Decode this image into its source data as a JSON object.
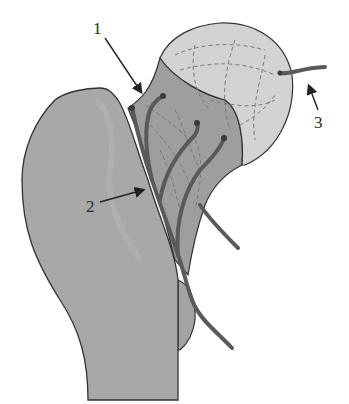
{
  "diagram": {
    "labels": [
      {
        "id": "1",
        "text": "1"
      },
      {
        "id": "2",
        "text": "2"
      },
      {
        "id": "3",
        "text": "3"
      }
    ],
    "colors": {
      "bone": "#a8a8a8",
      "bone_dark": "#9a9a9a",
      "neck": "#a0a0a0",
      "head": "#d2d2d2",
      "vessel": "#5a5a5a",
      "outline": "#333333",
      "dashes": "#7a7a7a"
    }
  }
}
